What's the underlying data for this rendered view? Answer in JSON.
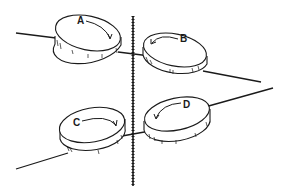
{
  "diagram": {
    "type": "physics-illustration",
    "colors": {
      "ink": "#1a1a1a",
      "background": "#ffffff"
    },
    "disks": [
      {
        "id": "A",
        "label": "A",
        "rotation": "clockwise",
        "position": "upper-left"
      },
      {
        "id": "B",
        "label": "B",
        "rotation": "counterclockwise",
        "position": "upper-right"
      },
      {
        "id": "C",
        "label": "C",
        "rotation": "clockwise",
        "position": "lower-left"
      },
      {
        "id": "D",
        "label": "D",
        "rotation": "counterclockwise",
        "position": "lower-right"
      }
    ]
  }
}
